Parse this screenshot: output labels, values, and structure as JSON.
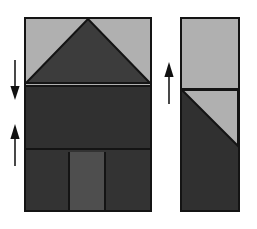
{
  "figure": {
    "width": 257,
    "height": 229,
    "background": "#ffffff"
  },
  "colors": {
    "outline": "#141414",
    "light_fill": "#b0b0b0",
    "dark_fill": "#303030",
    "mid_fill": "#4e4e4e",
    "lower_fill": "#333333",
    "arrow": "#1a1a1a",
    "page_background": "#ffffff"
  },
  "front_elevation": {
    "name": "front-elevation",
    "regions": [
      {
        "id": "gable-field",
        "label": "upper gable field",
        "fill": "#b0b0b0"
      },
      {
        "id": "gable-triangle",
        "label": "gable roof triangle",
        "fill": "#3c3c3c"
      },
      {
        "id": "middle-band",
        "label": "middle wall band",
        "fill": "#303030"
      },
      {
        "id": "lower-band",
        "label": "lower wall band",
        "fill": "#333333"
      },
      {
        "id": "door-panel",
        "label": "central door panel",
        "fill": "#4e4e4e"
      }
    ]
  },
  "side_elevation": {
    "name": "side-elevation",
    "regions": [
      {
        "id": "upper-band",
        "label": "upper band",
        "fill": "#b0b0b0"
      },
      {
        "id": "roof-slope",
        "label": "sloped roof plane",
        "fill": "#b0b0b0"
      },
      {
        "id": "lower-section",
        "label": "lower wall section",
        "fill": "#303030"
      }
    ]
  },
  "annotations": {
    "arrows": [
      {
        "id": "dim-arrow-eave-down",
        "direction": "down",
        "target": "front eave line"
      },
      {
        "id": "dim-arrow-floor-up",
        "direction": "up",
        "target": "front lower band line"
      },
      {
        "id": "dim-arrow-side-up",
        "direction": "up",
        "target": "side elevation divider line"
      }
    ]
  }
}
